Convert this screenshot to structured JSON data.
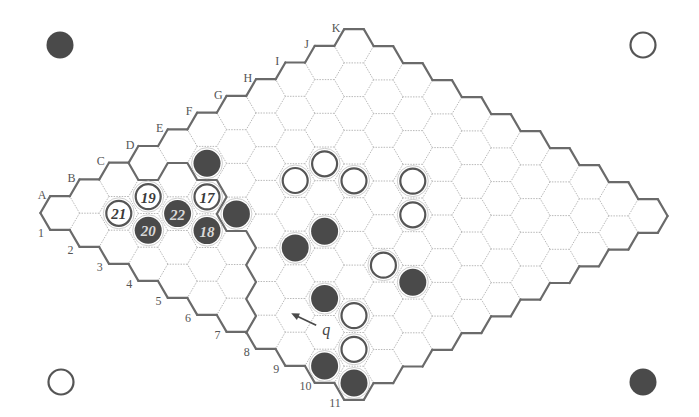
{
  "diagram": {
    "type": "hex-board",
    "size": 11,
    "row_labels": [
      "A",
      "B",
      "C",
      "D",
      "E",
      "F",
      "G",
      "H",
      "I",
      "J",
      "K"
    ],
    "col_labels": [
      "1",
      "2",
      "3",
      "4",
      "5",
      "6",
      "7",
      "8",
      "9",
      "10",
      "11"
    ],
    "colors": {
      "black_stone": "#4a4a4a",
      "white_stone": "#ffffff",
      "border": "#6a6a6a",
      "grid": "#b9b9b9"
    }
  },
  "corner_markers": [
    {
      "position": "top-left",
      "color": "black"
    },
    {
      "position": "top-right",
      "color": "white"
    },
    {
      "position": "bottom-left",
      "color": "white"
    },
    {
      "position": "bottom-right",
      "color": "black"
    }
  ],
  "stones": [
    {
      "cell": "E2",
      "color": "black",
      "label": ""
    },
    {
      "cell": "C2",
      "color": "white",
      "label": "19"
    },
    {
      "cell": "D3",
      "color": "white",
      "label": "17"
    },
    {
      "cell": "B2",
      "color": "white",
      "label": "21"
    },
    {
      "cell": "C3",
      "color": "black",
      "label": "22"
    },
    {
      "cell": "D4",
      "color": "black",
      "label": ""
    },
    {
      "cell": "B3",
      "color": "black",
      "label": "20"
    },
    {
      "cell": "C4",
      "color": "black",
      "label": "18"
    },
    {
      "cell": "G4",
      "color": "white",
      "label": ""
    },
    {
      "cell": "F4",
      "color": "white",
      "label": ""
    },
    {
      "cell": "G5",
      "color": "white",
      "label": ""
    },
    {
      "cell": "H6",
      "color": "white",
      "label": ""
    },
    {
      "cell": "G7",
      "color": "white",
      "label": ""
    },
    {
      "cell": "E6",
      "color": "black",
      "label": ""
    },
    {
      "cell": "D6",
      "color": "black",
      "label": ""
    },
    {
      "cell": "E8",
      "color": "white",
      "label": ""
    },
    {
      "cell": "E9",
      "color": "black",
      "label": ""
    },
    {
      "cell": "C8",
      "color": "black",
      "label": ""
    },
    {
      "cell": "C9",
      "color": "white",
      "label": ""
    },
    {
      "cell": "B10",
      "color": "white",
      "label": ""
    },
    {
      "cell": "A10",
      "color": "black",
      "label": ""
    },
    {
      "cell": "A11",
      "color": "black",
      "label": ""
    }
  ],
  "marked_point": {
    "cell": "B8",
    "label": "q",
    "arrow": true
  },
  "group_boundary": [
    [
      128.6,
      163
    ],
    [
      138.4,
      180
    ],
    [
      158,
      180
    ],
    [
      167.8,
      163
    ],
    [
      187.4,
      163
    ],
    [
      197.2,
      180
    ],
    [
      216.8,
      180
    ],
    [
      226.6,
      197
    ],
    [
      216.8,
      214
    ],
    [
      226.6,
      231
    ],
    [
      246.2,
      231
    ],
    [
      256,
      248
    ],
    [
      246.2,
      265
    ],
    [
      256,
      282
    ],
    [
      246.2,
      299
    ],
    [
      256,
      316
    ],
    [
      246.2,
      333
    ]
  ]
}
